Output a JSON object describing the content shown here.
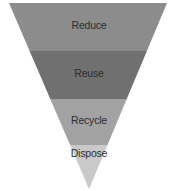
{
  "diagram": {
    "type": "inverted-pyramid",
    "title": "",
    "levels": [
      {
        "label": "Reduce",
        "color": "#8c8c8c"
      },
      {
        "label": "Reuse",
        "color": "#707070"
      },
      {
        "label": "Recycle",
        "color": "#a2a2a2"
      },
      {
        "label": "Dispose",
        "color": "#c9c9c9"
      }
    ],
    "text_color": "#2e2e2e"
  }
}
